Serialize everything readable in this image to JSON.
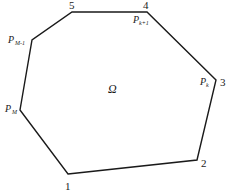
{
  "diagram": {
    "type": "polygon",
    "region_label": "Ω",
    "stroke_color": "#1a1a1a",
    "vertices": [
      {
        "id": "1",
        "x": 68,
        "y": 174
      },
      {
        "id": "2",
        "x": 197,
        "y": 160
      },
      {
        "id": "3",
        "x": 216,
        "y": 80
      },
      {
        "id": "4",
        "x": 147,
        "y": 12
      },
      {
        "id": "5",
        "x": 72,
        "y": 12
      },
      {
        "id": "P_{M-1}",
        "x": 32,
        "y": 40
      },
      {
        "id": "P_M",
        "x": 20,
        "y": 110
      }
    ],
    "labels": {
      "v1": "1",
      "v2": "2",
      "v3": "3",
      "v4": "4",
      "v5": "5",
      "pk_main": "P",
      "pk_sub": "k",
      "pk1_main": "P",
      "pk1_sub": "k+1",
      "pm1_main": "P",
      "pm1_sub": "M-1",
      "pm_main": "P",
      "pm_sub": "M"
    }
  }
}
